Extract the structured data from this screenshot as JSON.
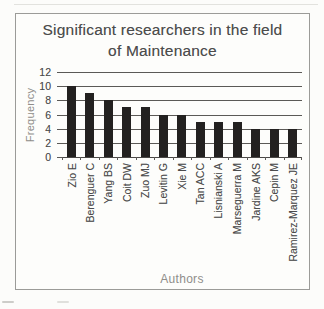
{
  "chart_data": {
    "type": "bar",
    "title": "Significant researchers in the field of Maintenance",
    "title_lines": [
      "Significant researchers in the field",
      "of Maintenance"
    ],
    "xlabel": "Authors",
    "ylabel": "Frequency",
    "categories": [
      "Zio E",
      "Berenguer C",
      "Yang BS",
      "Coit DW",
      "Zuo MJ",
      "Levitin G",
      "Xie M",
      "Tan ACC",
      "Lisnianski A",
      "Marseguerra M",
      "Jardine AKS",
      "Cepin M",
      "Ramirez-Marquez JE"
    ],
    "values": [
      10,
      9,
      8,
      7,
      7,
      6,
      6,
      5,
      5,
      5,
      4,
      4,
      4
    ],
    "ylim": [
      0,
      12
    ],
    "ytick_step": 2,
    "ytick_labels": [
      "0",
      "2",
      "4",
      "6",
      "8",
      "10",
      "12"
    ],
    "grid": "horizontal",
    "legend": "none",
    "bar_color": "#232120",
    "gridline_color": "#5b5956",
    "axis_line_color": "#4a4846",
    "tick_label_color": "#4c4c4c",
    "axis_title_color": "#8f8d8a",
    "title_color": "#4c4c4c",
    "frame_border_color": "#9b9b98"
  }
}
